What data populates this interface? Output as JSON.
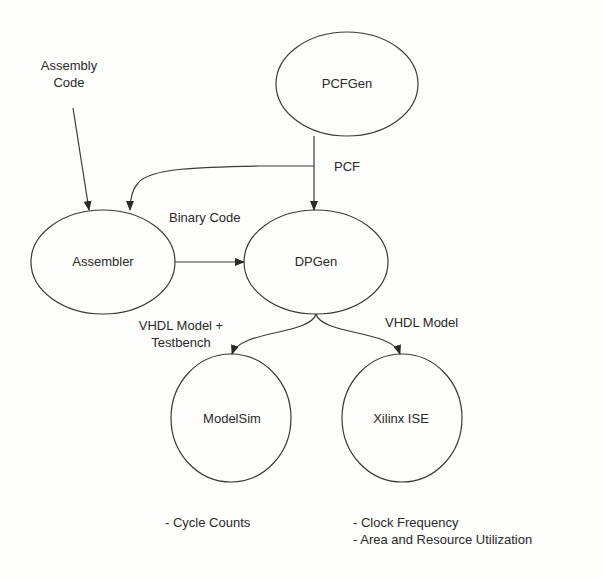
{
  "nodes": {
    "pcfgen": "PCFGen",
    "assembler": "Assembler",
    "dpgen": "DPGen",
    "modelsim": "ModelSim",
    "xilinx": "Xilinx ISE"
  },
  "inputs": {
    "assembly_code_line1": "Assembly",
    "assembly_code_line2": "Code"
  },
  "edge_labels": {
    "pcf": "PCF",
    "binary_code": "Binary Code",
    "vhdl_testbench_line1": "VHDL Model +",
    "vhdl_testbench_line2": "Testbench",
    "vhdl_model": "VHDL Model"
  },
  "outputs": {
    "modelsim": [
      "- Cycle Counts"
    ],
    "xilinx": [
      "- Clock Frequency",
      "- Area and Resource Utilization"
    ]
  },
  "colors": {
    "stroke": "#3a3a3a",
    "background": "#fdfdfb"
  }
}
